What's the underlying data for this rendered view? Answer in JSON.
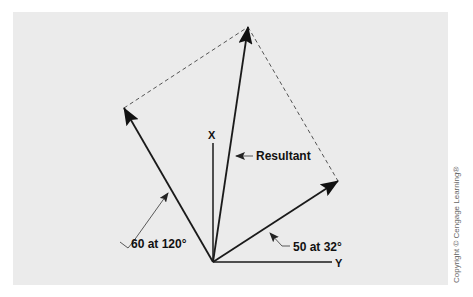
{
  "diagram": {
    "type": "vector-addition-parallelogram",
    "axes": {
      "x_label": "X",
      "y_label": "Y"
    },
    "vectors": [
      {
        "name": "vector-60",
        "label": "60 at 120°",
        "magnitude": 60,
        "angle_deg": 120
      },
      {
        "name": "vector-50",
        "label": "50 at 32°",
        "magnitude": 50,
        "angle_deg": 32
      },
      {
        "name": "resultant",
        "label": "Resultant"
      }
    ],
    "colors": {
      "background": "#ebebeb",
      "stroke": "#1a1a1a",
      "dashed": "#555555"
    }
  },
  "copyright": "Copyright © Cengage Learning®"
}
